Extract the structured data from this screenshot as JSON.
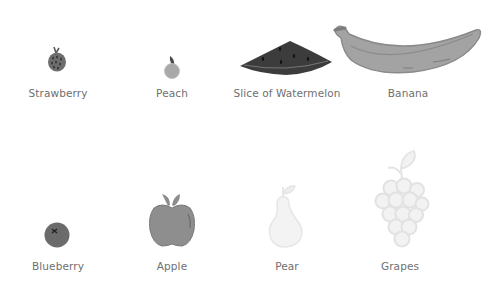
{
  "fruits": [
    {
      "name": "Strawberry",
      "icon": "strawberry-icon",
      "row": 1,
      "color": "#6a6a6a"
    },
    {
      "name": "Peach",
      "icon": "peach-icon",
      "row": 1,
      "color": "#a8a8a8"
    },
    {
      "name": "Slice of Watermelon",
      "icon": "watermelon-slice-icon",
      "row": 1,
      "color": "#3a3a3a"
    },
    {
      "name": "Banana",
      "icon": "banana-icon",
      "row": 1,
      "color": "#a2a2a2"
    },
    {
      "name": "Blueberry",
      "icon": "blueberry-icon",
      "row": 2,
      "color": "#6c6c6c"
    },
    {
      "name": "Apple",
      "icon": "apple-icon",
      "row": 2,
      "color": "#8f8f8f"
    },
    {
      "name": "Pear",
      "icon": "pear-icon",
      "row": 2,
      "color": "#f0f0f0"
    },
    {
      "name": "Grapes",
      "icon": "grapes-icon",
      "row": 2,
      "color": "#f0f0f0"
    }
  ]
}
